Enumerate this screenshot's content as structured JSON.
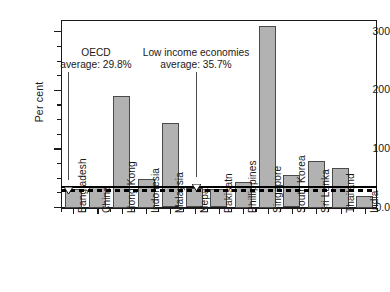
{
  "chart_data": {
    "type": "bar",
    "title": "",
    "xlabel": "",
    "ylabel": "Per cent",
    "ylim": [
      0,
      320
    ],
    "ytick_labels": [
      "0.0",
      "100",
      "200",
      "300"
    ],
    "ytick_values": [
      0,
      100,
      200,
      300
    ],
    "grid": false,
    "legend": "none",
    "categories": [
      "Bangladesh",
      "China",
      "Hong Kong",
      "Indonesia",
      "Malaysia",
      "Nepal",
      "Pakisatn",
      "Phillippines",
      "Singapore",
      "South Korea",
      "Sri Lanka",
      "Thailand",
      "India"
    ],
    "values": [
      32,
      36,
      190,
      48,
      145,
      33,
      31,
      44,
      310,
      55,
      80,
      68,
      20
    ],
    "bar_color": "#b2b2b2",
    "bar_edge_color": "#4a4a4a",
    "reference_lines": [
      {
        "name": "low-income-average",
        "label_line1": "Low income economies",
        "label_line2": "average: 35.7%",
        "value": 35.7,
        "style": "solid",
        "color": "#000000"
      },
      {
        "name": "oecd-average",
        "label_line1": "OECD",
        "label_line2": "average: 29.8%",
        "value": 29.8,
        "style": "dashed",
        "color": "#000000"
      }
    ]
  }
}
